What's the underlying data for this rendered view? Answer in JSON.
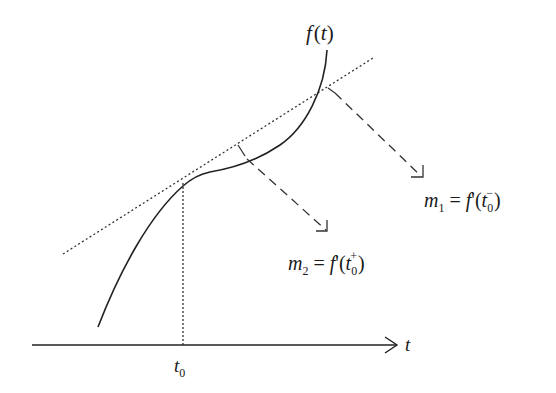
{
  "diagram": {
    "function_label": {
      "base": "f",
      "open": "(",
      "var": "t",
      "close": ")"
    },
    "axis": {
      "label": "t"
    },
    "point": {
      "base": "t",
      "sub": "0"
    },
    "annotations": [
      {
        "id": "m1",
        "symbol": "m",
        "symbol_sub": "1",
        "eq": "=",
        "fn": "f",
        "prime": "'",
        "open": "(",
        "arg": "t",
        "arg_sub": "0",
        "arg_sup": "−",
        "close": ")",
        "meaning": "left derivative"
      },
      {
        "id": "m2",
        "symbol": "m",
        "symbol_sub": "2",
        "eq": "=",
        "fn": "f",
        "prime": "'",
        "open": "(",
        "arg": "t",
        "arg_sub": "0",
        "arg_sup": "+",
        "close": ")",
        "meaning": "right derivative"
      }
    ],
    "colors": {
      "ink": "#222222",
      "background": "#ffffff"
    }
  }
}
